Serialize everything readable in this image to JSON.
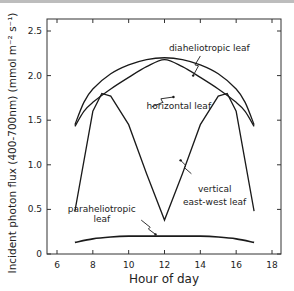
{
  "chart_data": {
    "type": "line",
    "title": "",
    "xlabel": "Hour of day",
    "ylabel": "Incident photon flux (400-700nm) (mmol m⁻² s⁻¹)",
    "xlim": [
      5.5,
      18.5
    ],
    "ylim": [
      0,
      2.6
    ],
    "xticks": [
      6,
      8,
      10,
      12,
      14,
      16,
      18
    ],
    "xtick_labels": [
      "6",
      "8",
      "10",
      "12",
      "14",
      "16",
      "18"
    ],
    "yticks": [
      0,
      0.5,
      1.0,
      1.5,
      2.0,
      2.5
    ],
    "ytick_labels": [
      "0",
      "0.5",
      "1.0",
      "1.5",
      "2.0",
      "2.5"
    ],
    "grid": false,
    "legend": "none (inline annotations)",
    "series": [
      {
        "name": "diaheliotropic leaf",
        "x": [
          7,
          7.5,
          8,
          9,
          10,
          11,
          12,
          13,
          14,
          15,
          16,
          16.5,
          17
        ],
        "values": [
          1.45,
          1.7,
          1.85,
          2.02,
          2.12,
          2.18,
          2.2,
          2.18,
          2.12,
          2.02,
          1.85,
          1.7,
          1.45
        ]
      },
      {
        "name": "horizontal leaf",
        "x": [
          7,
          7.5,
          8,
          9,
          10,
          11,
          12,
          13,
          14,
          15,
          16,
          16.5,
          17
        ],
        "values": [
          1.43,
          1.6,
          1.7,
          1.85,
          1.98,
          2.1,
          2.18,
          2.1,
          1.98,
          1.85,
          1.7,
          1.6,
          1.43
        ]
      },
      {
        "name": "vertical east-west leaf",
        "x": [
          7,
          8,
          8.5,
          9,
          10,
          11,
          12,
          13,
          14,
          15,
          15.5,
          16,
          17
        ],
        "values": [
          0.48,
          1.6,
          1.8,
          1.77,
          1.45,
          0.9,
          0.38,
          0.9,
          1.45,
          1.77,
          1.8,
          1.6,
          0.48
        ]
      },
      {
        "name": "paraheliotropic leaf",
        "x": [
          7,
          8,
          9,
          10,
          11,
          12,
          13,
          14,
          15,
          16,
          17
        ],
        "values": [
          0.13,
          0.17,
          0.19,
          0.2,
          0.2,
          0.2,
          0.2,
          0.2,
          0.19,
          0.17,
          0.13
        ]
      }
    ],
    "annotations": [
      {
        "text": "diaheliotropic leaf",
        "x": 14.5,
        "y": 2.28
      },
      {
        "text": "horizontal leaf",
        "x": 12.8,
        "y": 1.62
      },
      {
        "text": "vertical",
        "x": 14.8,
        "y": 0.7
      },
      {
        "text": "east-west leaf",
        "x": 14.8,
        "y": 0.55
      },
      {
        "text": "paraheliotropic",
        "x": 8.5,
        "y": 0.47
      },
      {
        "text": "leaf",
        "x": 8.5,
        "y": 0.36
      }
    ]
  }
}
